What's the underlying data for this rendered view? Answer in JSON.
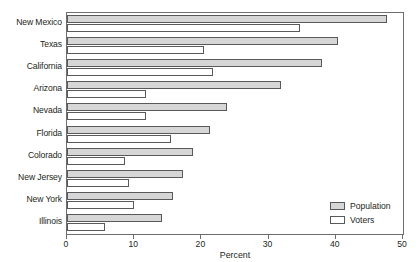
{
  "chart_data": {
    "type": "bar",
    "orientation": "horizontal",
    "title": "",
    "xlabel": "Percent",
    "ylabel": "",
    "xlim": [
      0,
      50
    ],
    "xticks": [
      0,
      10,
      20,
      30,
      40,
      50
    ],
    "xtick_labels": [
      "0",
      "10",
      "20",
      "30",
      "40",
      "50"
    ],
    "grid": false,
    "legend_position": "bottom-right",
    "categories": [
      "New Mexico",
      "Texas",
      "California",
      "Arizona",
      "Nevada",
      "Florida",
      "Colorado",
      "New Jersey",
      "New York",
      "Illinois"
    ],
    "series": [
      {
        "name": "Population",
        "color": "#d6d6d6",
        "values": [
          47.6,
          40.4,
          38.0,
          31.8,
          23.8,
          21.3,
          18.8,
          17.3,
          15.7,
          14.1
        ]
      },
      {
        "name": "Voters",
        "color": "#ffffff",
        "values": [
          34.6,
          20.4,
          21.7,
          11.8,
          11.7,
          15.5,
          8.7,
          9.2,
          9.9,
          5.6
        ]
      }
    ]
  },
  "legend": {
    "items": [
      {
        "label": "Population",
        "swatch": "population"
      },
      {
        "label": "Voters",
        "swatch": "voters"
      }
    ]
  },
  "colors": {
    "population_fill": "#d6d6d6",
    "voters_fill": "#ffffff",
    "bar_stroke": "#58595b",
    "frame": "#6d6e71",
    "text": "#231f20"
  }
}
